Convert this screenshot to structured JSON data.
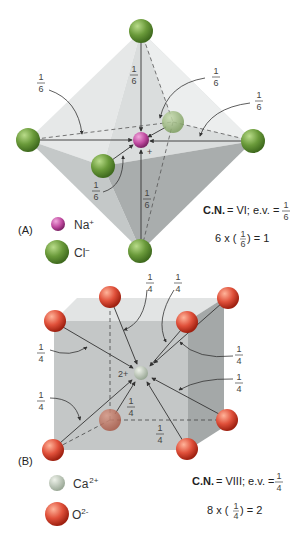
{
  "panel_a": {
    "label": "(A)",
    "legend": [
      {
        "ion": "Na",
        "charge": "+",
        "color": "#c04aa0"
      },
      {
        "ion": "Cl",
        "charge": "−",
        "color": "#6a9a3a"
      }
    ],
    "cn_label": "C.N.",
    "cn_value": "= VI;",
    "ev_label": "e.v. =",
    "ev_num": "1",
    "ev_den": "6",
    "sum_prefix": "6 x (",
    "sum_suffix": ") = 1",
    "fraction": {
      "num": "1",
      "den": "6"
    },
    "center_charge": "+"
  },
  "panel_b": {
    "label": "(B)",
    "legend": [
      {
        "ion": "Ca",
        "charge": "2+",
        "color": "#b8c4b0"
      },
      {
        "ion": "O",
        "charge": "2-",
        "color": "#e0503a"
      }
    ],
    "cn_label": "C.N.",
    "cn_value": "= VIII;",
    "ev_label": "e.v. =",
    "ev_num": "1",
    "ev_den": "4",
    "sum_prefix": "8 x (",
    "sum_suffix": ") = 2",
    "fraction": {
      "num": "1",
      "den": "4"
    },
    "center_charge": "2+"
  },
  "colors": {
    "chloride": "#6a9a3a",
    "sodium": "#c04aa0",
    "calcium": "#b8c4b0",
    "oxide": "#e0503a",
    "solid_light": "#e4e6e6",
    "solid_mid": "#cfd2d2",
    "solid_dark": "#b4b8b8"
  }
}
